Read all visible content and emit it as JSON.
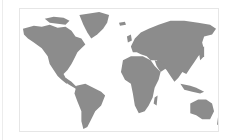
{
  "map": {
    "type": "world-map",
    "land_color": "#8c8c8c",
    "background_color": "#ffffff",
    "frame_color": "#e6e6e6",
    "regions": [
      "north-america",
      "greenland",
      "south-america",
      "europe",
      "africa",
      "asia",
      "australia",
      "new-zealand",
      "madagascar",
      "japan",
      "indonesia",
      "uk",
      "iceland"
    ]
  }
}
